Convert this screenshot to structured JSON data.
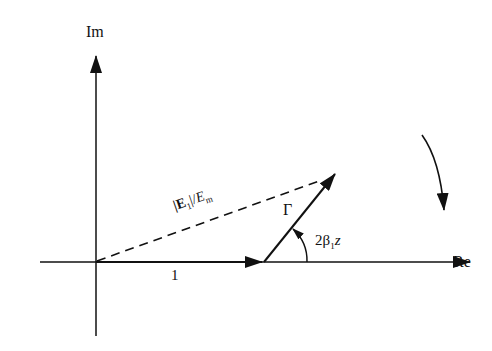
{
  "diagram": {
    "axes": {
      "vertical_label": "Im",
      "horizontal_label": "Re"
    },
    "vectors": {
      "unit_label": "1",
      "gamma_label": "Γ",
      "resultant_label_num": "|E",
      "resultant_label_sub1": "1",
      "resultant_label_mid": "|/",
      "resultant_label_E": "E",
      "resultant_label_sub2": "m"
    },
    "angle": {
      "label_prefix": "2β",
      "label_sub": "1",
      "label_suffix": "z"
    },
    "rotation_arrow": "clockwise-arrow"
  }
}
